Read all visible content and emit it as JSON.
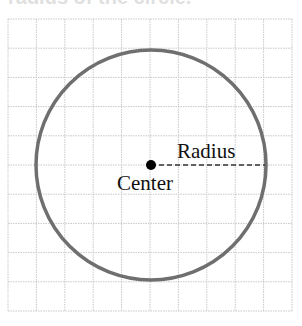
{
  "heading": "radius of the circle.",
  "diagram": {
    "grid": {
      "x0": 8,
      "y0": 19,
      "cols": 10,
      "rows": 10,
      "cell_w": 28.4,
      "cell_h": 29.2,
      "color": "#c8c8c8"
    },
    "circle": {
      "cx": 151,
      "cy": 165,
      "r": 115,
      "stroke": "#6f6f6f",
      "stroke_width": 3.5
    },
    "center_point": {
      "x": 151,
      "y": 165,
      "r": 5,
      "color": "#000000"
    },
    "radius_line": {
      "x1": 151,
      "y1": 165,
      "x2": 265,
      "y2": 165,
      "color": "#333333"
    },
    "labels": {
      "radius": "Radius",
      "center": "Center"
    }
  }
}
